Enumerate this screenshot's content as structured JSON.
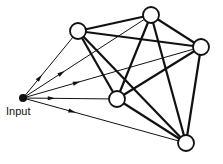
{
  "diagram": {
    "type": "fully-connected-recurrent-network",
    "input_label": "Input",
    "colors": {
      "stroke": "#111111",
      "node_fill": "#ffffff",
      "input_fill": "#111111"
    },
    "input_node": {
      "x": 23,
      "y": 98
    },
    "nodes": [
      {
        "id": "A",
        "x": 78,
        "y": 31
      },
      {
        "id": "B",
        "x": 151,
        "y": 15
      },
      {
        "id": "C",
        "x": 201,
        "y": 47
      },
      {
        "id": "D",
        "x": 117,
        "y": 99
      },
      {
        "id": "E",
        "x": 186,
        "y": 143
      }
    ],
    "input_edges": [
      "A",
      "B",
      "C",
      "D",
      "E"
    ],
    "recurrent_edges": [
      [
        "A",
        "B"
      ],
      [
        "A",
        "C"
      ],
      [
        "A",
        "D"
      ],
      [
        "A",
        "E"
      ],
      [
        "B",
        "C"
      ],
      [
        "B",
        "D"
      ],
      [
        "B",
        "E"
      ],
      [
        "C",
        "D"
      ],
      [
        "C",
        "E"
      ],
      [
        "D",
        "E"
      ]
    ]
  }
}
